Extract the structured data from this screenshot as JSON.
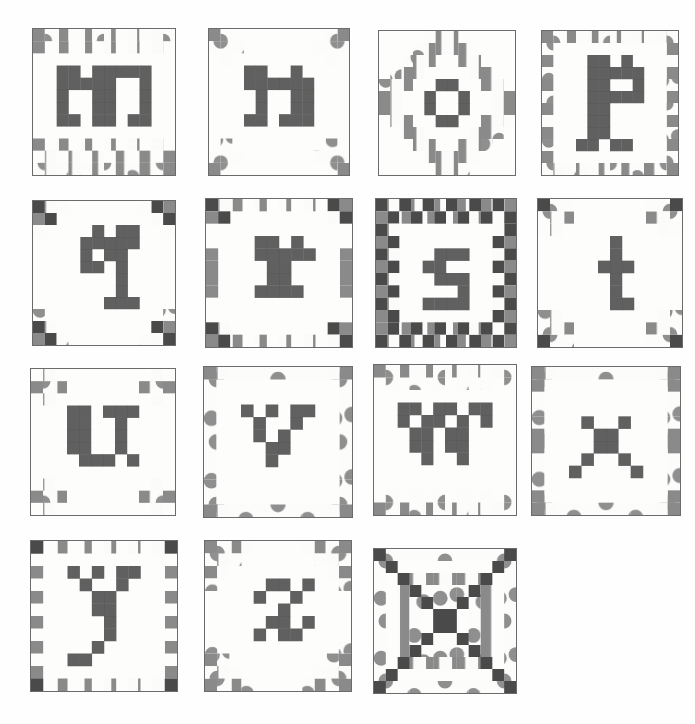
{
  "page": {
    "background_color": "#ffffff",
    "width": 695,
    "height": 724,
    "grid_columns": 4,
    "grid_rows": 4,
    "style": "graph-paper pencil sketch, pixel-letter quilt piecing diagrams"
  },
  "palette": {
    "paper": "#fdfdfc",
    "block_outline": "#6b6b6b",
    "dark_fill": "#4a4a4a",
    "medium_fill": "#8d8d8d",
    "hatch_fill": "#9a9a9a",
    "stipple_fill": "#b4b4b4",
    "light_fill": "#d8d8d8"
  },
  "legend": {
    "fabric_dark": "solid dark value",
    "fabric_hatch": "vertical hatch / striped value",
    "fabric_stipple": "dotted / stipple value",
    "fabric_light": "background light value"
  },
  "blocks": [
    {
      "id": "block-m",
      "letter": "m",
      "label": "letter-m-quilt-block",
      "row": 0,
      "col": 0,
      "x": 32,
      "y": 28,
      "w": 144,
      "h": 148,
      "cells": 12,
      "border_style": "double-row-checker-top-bottom",
      "border_rows": {
        "top": 2,
        "bottom": 3,
        "left": 0,
        "right": 0
      },
      "letter_cells": [
        [
          2,
          3
        ],
        [
          3,
          3
        ],
        [
          5,
          3
        ],
        [
          6,
          3
        ],
        [
          7,
          3
        ],
        [
          8,
          3
        ],
        [
          9,
          3
        ],
        [
          2,
          4
        ],
        [
          3,
          4
        ],
        [
          4,
          4
        ],
        [
          5,
          4
        ],
        [
          6,
          4
        ],
        [
          9,
          4
        ],
        [
          2,
          5
        ],
        [
          5,
          5
        ],
        [
          6,
          5
        ],
        [
          9,
          5
        ],
        [
          2,
          6
        ],
        [
          5,
          6
        ],
        [
          6,
          6
        ],
        [
          9,
          6
        ],
        [
          2,
          7
        ],
        [
          3,
          7
        ],
        [
          5,
          7
        ],
        [
          6,
          7
        ],
        [
          8,
          7
        ],
        [
          9,
          7
        ]
      ]
    },
    {
      "id": "block-n",
      "letter": "n",
      "label": "letter-n-quilt-block",
      "row": 0,
      "col": 1,
      "x": 208,
      "y": 28,
      "w": 142,
      "h": 148,
      "cells": 12,
      "border_style": "corner-clusters",
      "border_rows": {
        "top": 0,
        "bottom": 0,
        "left": 0,
        "right": 0
      },
      "letter_cells": [
        [
          3,
          3
        ],
        [
          4,
          3
        ],
        [
          7,
          3
        ],
        [
          3,
          4
        ],
        [
          4,
          4
        ],
        [
          5,
          4
        ],
        [
          6,
          4
        ],
        [
          7,
          4
        ],
        [
          8,
          4
        ],
        [
          4,
          5
        ],
        [
          7,
          5
        ],
        [
          8,
          5
        ],
        [
          4,
          6
        ],
        [
          7,
          6
        ],
        [
          8,
          6
        ],
        [
          3,
          7
        ],
        [
          4,
          7
        ],
        [
          6,
          7
        ],
        [
          7,
          7
        ],
        [
          8,
          7
        ]
      ]
    },
    {
      "id": "block-o",
      "letter": "o",
      "label": "letter-o-quilt-block",
      "row": 0,
      "col": 2,
      "x": 378,
      "y": 30,
      "w": 138,
      "h": 146,
      "cells": 12,
      "border_style": "diamond-medallion",
      "border_rows": {
        "top": 0,
        "bottom": 0,
        "left": 0,
        "right": 0
      },
      "letter_cells": [
        [
          5,
          4
        ],
        [
          6,
          4
        ],
        [
          4,
          5
        ],
        [
          7,
          5
        ],
        [
          4,
          6
        ],
        [
          7,
          6
        ],
        [
          5,
          7
        ],
        [
          6,
          7
        ]
      ]
    },
    {
      "id": "block-p",
      "letter": "p",
      "label": "letter-p-quilt-block",
      "row": 0,
      "col": 3,
      "x": 541,
      "y": 30,
      "w": 138,
      "h": 146,
      "cells": 12,
      "border_style": "full-alternating-frame",
      "border_rows": {
        "top": 1,
        "bottom": 1,
        "left": 1,
        "right": 1
      },
      "letter_cells": [
        [
          4,
          2
        ],
        [
          5,
          2
        ],
        [
          7,
          2
        ],
        [
          4,
          3
        ],
        [
          5,
          3
        ],
        [
          6,
          3
        ],
        [
          7,
          3
        ],
        [
          8,
          3
        ],
        [
          4,
          4
        ],
        [
          5,
          4
        ],
        [
          8,
          4
        ],
        [
          4,
          5
        ],
        [
          5,
          5
        ],
        [
          6,
          5
        ],
        [
          7,
          5
        ],
        [
          8,
          5
        ],
        [
          4,
          6
        ],
        [
          5,
          6
        ],
        [
          4,
          7
        ],
        [
          5,
          7
        ],
        [
          4,
          8
        ],
        [
          5,
          8
        ],
        [
          3,
          9
        ],
        [
          4,
          9
        ],
        [
          6,
          9
        ],
        [
          7,
          9
        ]
      ]
    },
    {
      "id": "block-q",
      "letter": "q",
      "label": "letter-q-quilt-block",
      "row": 1,
      "col": 0,
      "x": 32,
      "y": 200,
      "w": 144,
      "h": 146,
      "cells": 12,
      "border_style": "corner-nine-patch",
      "border_rows": {
        "top": 0,
        "bottom": 0,
        "left": 0,
        "right": 0
      },
      "letter_cells": [
        [
          5,
          2
        ],
        [
          7,
          2
        ],
        [
          8,
          2
        ],
        [
          4,
          3
        ],
        [
          5,
          3
        ],
        [
          6,
          3
        ],
        [
          7,
          3
        ],
        [
          8,
          3
        ],
        [
          4,
          4
        ],
        [
          6,
          4
        ],
        [
          7,
          4
        ],
        [
          4,
          5
        ],
        [
          5,
          5
        ],
        [
          7,
          5
        ],
        [
          7,
          6
        ],
        [
          7,
          7
        ],
        [
          6,
          8
        ],
        [
          7,
          8
        ],
        [
          8,
          8
        ]
      ]
    },
    {
      "id": "block-r",
      "letter": "r",
      "label": "letter-r-quilt-block",
      "row": 1,
      "col": 1,
      "x": 205,
      "y": 198,
      "w": 148,
      "h": 150,
      "cells": 12,
      "border_style": "corner-and-side-bars",
      "border_rows": {
        "top": 0,
        "bottom": 0,
        "left": 0,
        "right": 0
      },
      "letter_cells": [
        [
          4,
          3
        ],
        [
          5,
          3
        ],
        [
          7,
          3
        ],
        [
          4,
          4
        ],
        [
          5,
          4
        ],
        [
          6,
          4
        ],
        [
          7,
          4
        ],
        [
          8,
          4
        ],
        [
          5,
          5
        ],
        [
          6,
          5
        ],
        [
          5,
          6
        ],
        [
          6,
          6
        ],
        [
          4,
          7
        ],
        [
          5,
          7
        ],
        [
          6,
          7
        ],
        [
          7,
          7
        ]
      ]
    },
    {
      "id": "block-s",
      "letter": "s",
      "label": "letter-s-quilt-block",
      "row": 1,
      "col": 2,
      "x": 375,
      "y": 198,
      "w": 142,
      "h": 150,
      "cells": 12,
      "border_style": "checkerboard-frame",
      "border_rows": {
        "top": 2,
        "bottom": 2,
        "left": 2,
        "right": 2
      },
      "letter_cells": [
        [
          5,
          4
        ],
        [
          6,
          4
        ],
        [
          7,
          4
        ],
        [
          4,
          5
        ],
        [
          5,
          5
        ],
        [
          5,
          6
        ],
        [
          6,
          6
        ],
        [
          7,
          6
        ],
        [
          7,
          7
        ],
        [
          4,
          8
        ],
        [
          5,
          8
        ],
        [
          6,
          8
        ],
        [
          7,
          8
        ]
      ]
    },
    {
      "id": "block-t",
      "letter": "t",
      "label": "letter-t-quilt-block",
      "row": 1,
      "col": 3,
      "x": 537,
      "y": 198,
      "w": 146,
      "h": 150,
      "cells": 12,
      "border_style": "stepped-corners",
      "border_rows": {
        "top": 0,
        "bottom": 0,
        "left": 0,
        "right": 0
      },
      "letter_cells": [
        [
          6,
          3
        ],
        [
          6,
          4
        ],
        [
          5,
          5
        ],
        [
          6,
          5
        ],
        [
          7,
          5
        ],
        [
          6,
          6
        ],
        [
          6,
          7
        ],
        [
          6,
          8
        ],
        [
          7,
          8
        ]
      ]
    },
    {
      "id": "block-u",
      "letter": "u",
      "label": "letter-u-quilt-block",
      "row": 2,
      "col": 0,
      "x": 30,
      "y": 368,
      "w": 146,
      "h": 148,
      "cells": 12,
      "border_style": "four-corner-pinwheels",
      "border_rows": {
        "top": 0,
        "bottom": 0,
        "left": 0,
        "right": 0
      },
      "letter_cells": [
        [
          3,
          3
        ],
        [
          4,
          3
        ],
        [
          6,
          3
        ],
        [
          7,
          3
        ],
        [
          8,
          3
        ],
        [
          3,
          4
        ],
        [
          4,
          4
        ],
        [
          7,
          4
        ],
        [
          3,
          5
        ],
        [
          4,
          5
        ],
        [
          7,
          5
        ],
        [
          3,
          6
        ],
        [
          4,
          6
        ],
        [
          7,
          6
        ],
        [
          4,
          7
        ],
        [
          5,
          7
        ],
        [
          6,
          7
        ],
        [
          8,
          7
        ]
      ]
    },
    {
      "id": "block-v",
      "letter": "v",
      "label": "letter-v-quilt-block",
      "row": 2,
      "col": 1,
      "x": 203,
      "y": 366,
      "w": 150,
      "h": 152,
      "cells": 12,
      "border_style": "stipple-frame",
      "border_rows": {
        "top": 1,
        "bottom": 1,
        "left": 1,
        "right": 1
      },
      "letter_cells": [
        [
          3,
          3
        ],
        [
          5,
          3
        ],
        [
          7,
          3
        ],
        [
          8,
          3
        ],
        [
          4,
          4
        ],
        [
          7,
          4
        ],
        [
          4,
          5
        ],
        [
          6,
          5
        ],
        [
          5,
          6
        ],
        [
          6,
          6
        ],
        [
          5,
          7
        ]
      ]
    },
    {
      "id": "block-w",
      "letter": "w",
      "label": "letter-w-quilt-block",
      "row": 2,
      "col": 2,
      "x": 373,
      "y": 364,
      "w": 144,
      "h": 152,
      "cells": 12,
      "border_style": "hatch-and-dot-top-bottom",
      "border_rows": {
        "top": 1,
        "bottom": 1,
        "left": 0,
        "right": 0
      },
      "letter_cells": [
        [
          2,
          3
        ],
        [
          3,
          3
        ],
        [
          5,
          3
        ],
        [
          6,
          3
        ],
        [
          8,
          3
        ],
        [
          9,
          3
        ],
        [
          2,
          4
        ],
        [
          4,
          4
        ],
        [
          5,
          4
        ],
        [
          7,
          4
        ],
        [
          9,
          4
        ],
        [
          3,
          5
        ],
        [
          4,
          5
        ],
        [
          6,
          5
        ],
        [
          7,
          5
        ],
        [
          3,
          6
        ],
        [
          4,
          6
        ],
        [
          6,
          6
        ],
        [
          7,
          6
        ],
        [
          4,
          7
        ],
        [
          7,
          7
        ]
      ]
    },
    {
      "id": "block-x",
      "letter": "x",
      "label": "letter-x-quilt-block",
      "row": 2,
      "col": 3,
      "x": 531,
      "y": 366,
      "w": 150,
      "h": 150,
      "cells": 12,
      "border_style": "stipple-frame-corner-blocks",
      "border_rows": {
        "top": 1,
        "bottom": 1,
        "left": 1,
        "right": 1
      },
      "letter_cells": [
        [
          4,
          4
        ],
        [
          7,
          4
        ],
        [
          5,
          5
        ],
        [
          6,
          5
        ],
        [
          5,
          6
        ],
        [
          6,
          6
        ],
        [
          4,
          7
        ],
        [
          7,
          7
        ],
        [
          3,
          8
        ],
        [
          8,
          8
        ]
      ]
    },
    {
      "id": "block-y",
      "letter": "y",
      "label": "letter-y-quilt-block",
      "row": 3,
      "col": 0,
      "x": 30,
      "y": 540,
      "w": 148,
      "h": 152,
      "cells": 12,
      "border_style": "dashed-outer-frame",
      "border_rows": {
        "top": 1,
        "bottom": 1,
        "left": 1,
        "right": 1
      },
      "letter_cells": [
        [
          3,
          2
        ],
        [
          5,
          2
        ],
        [
          7,
          2
        ],
        [
          8,
          2
        ],
        [
          4,
          3
        ],
        [
          7,
          3
        ],
        [
          5,
          4
        ],
        [
          6,
          4
        ],
        [
          5,
          5
        ],
        [
          6,
          5
        ],
        [
          6,
          6
        ],
        [
          6,
          7
        ],
        [
          5,
          8
        ],
        [
          3,
          9
        ],
        [
          4,
          9
        ]
      ]
    },
    {
      "id": "block-z",
      "letter": "z",
      "label": "letter-z-quilt-block",
      "row": 3,
      "col": 1,
      "x": 204,
      "y": 540,
      "w": 148,
      "h": 152,
      "cells": 12,
      "border_style": "diagonal-stipple-corners",
      "border_rows": {
        "top": 0,
        "bottom": 0,
        "left": 0,
        "right": 0
      },
      "letter_cells": [
        [
          5,
          3
        ],
        [
          6,
          3
        ],
        [
          8,
          3
        ],
        [
          4,
          4
        ],
        [
          7,
          4
        ],
        [
          6,
          5
        ],
        [
          5,
          6
        ],
        [
          6,
          6
        ],
        [
          8,
          6
        ],
        [
          4,
          7
        ],
        [
          6,
          7
        ],
        [
          7,
          7
        ]
      ]
    },
    {
      "id": "block-ornament",
      "letter": "",
      "label": "log-cabin-ornamental-quilt-block",
      "row": 3,
      "col": 2,
      "x": 373,
      "y": 548,
      "w": 144,
      "h": 146,
      "cells": 12,
      "border_style": "concentric-log-cabin",
      "border_rows": {
        "top": 1,
        "bottom": 1,
        "left": 1,
        "right": 1
      },
      "letter_cells": []
    }
  ]
}
